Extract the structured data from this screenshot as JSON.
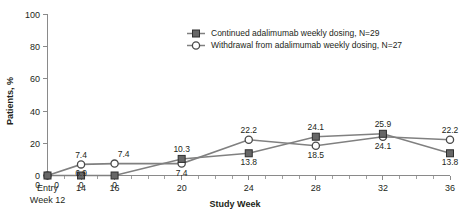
{
  "chart_data": {
    "type": "line",
    "title": "",
    "xlabel": "Study Week",
    "ylabel": "Patients, %",
    "xlim": [
      12,
      36
    ],
    "ylim": [
      0,
      100
    ],
    "grid": false,
    "legend_position": "top-right",
    "x": [
      12,
      14,
      16,
      20,
      24,
      28,
      32,
      36
    ],
    "categories": [
      "Entry Week 12",
      "14",
      "16",
      "20",
      "24",
      "28",
      "32",
      "36"
    ],
    "xtick_labels": [
      "Entry",
      "14",
      "16",
      "20",
      "24",
      "28",
      "32",
      "36"
    ],
    "xtick_sublabel": "Week 12",
    "ytick_labels": [
      "0",
      "20",
      "40",
      "60",
      "80",
      "100"
    ],
    "ytick_values": [
      0,
      20,
      40,
      60,
      80,
      100
    ],
    "series": [
      {
        "name": "Continued adalimumab weekly dosing, N=29",
        "marker": "square-filled",
        "values": [
          0,
          0,
          0,
          10.3,
          13.8,
          24.1,
          25.9,
          13.8
        ],
        "labels": [
          "0",
          "0",
          "0",
          "10.3",
          "13.8",
          "24.1",
          "25.9",
          "13.8"
        ],
        "label_position": [
          "below",
          "below",
          "below",
          "above",
          "below",
          "above",
          "above",
          "below"
        ]
      },
      {
        "name": "Withdrawal from adalimumab weekly dosing, N=27",
        "marker": "circle-open",
        "values": [
          0,
          6.9,
          7.4,
          7.4,
          22.2,
          18.5,
          24.1,
          22.2
        ],
        "labels": [
          "0",
          "6.9",
          "7.4",
          "7.4",
          "22.2",
          "18.5",
          "24.1",
          "22.2"
        ],
        "label_position": [
          "below",
          "below",
          "above",
          "below",
          "above",
          "below",
          "below",
          "above"
        ]
      }
    ],
    "extra_labels": [
      {
        "text": "7.4",
        "x": 14,
        "y": 6.9,
        "position": "above"
      }
    ]
  }
}
